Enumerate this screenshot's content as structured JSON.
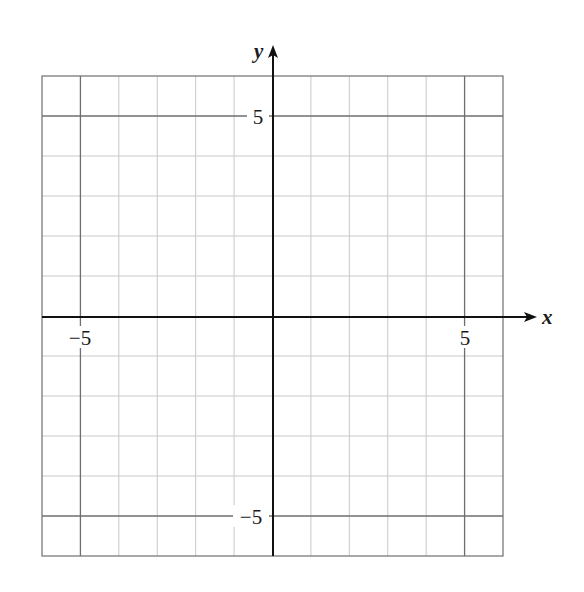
{
  "chart_data": {
    "type": "scatter",
    "title": "",
    "xlabel": "x",
    "ylabel": "y",
    "xlim": [
      -6,
      6
    ],
    "ylim": [
      -6,
      6
    ],
    "grid": true,
    "grid_step": 1,
    "major_lines": [
      -5,
      5
    ],
    "x_tick_labels": [
      {
        "value": -5,
        "label": "−5"
      },
      {
        "value": 5,
        "label": "5"
      }
    ],
    "y_tick_labels": [
      {
        "value": 5,
        "label": "5"
      },
      {
        "value": -5,
        "label": "−5"
      }
    ],
    "series": [],
    "legend": null
  },
  "labels": {
    "x_axis": "x",
    "y_axis": "y",
    "x_neg5": "−5",
    "x_pos5": "5",
    "y_pos5": "5",
    "y_neg5": "−5"
  },
  "colors": {
    "minor_grid": "#c8c8c8",
    "major_grid": "#6e6e6e",
    "axis": "#111111",
    "border": "#6e6e6e"
  }
}
